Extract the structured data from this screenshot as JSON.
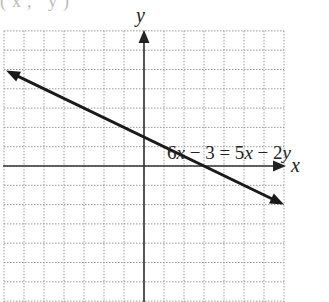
{
  "chart_data": {
    "type": "line",
    "title": "",
    "partial_top_label": "(x, y)",
    "xlabel": "x",
    "ylabel": "y",
    "xlim": [
      -7,
      7
    ],
    "ylim": [
      -7,
      7
    ],
    "grid": true,
    "grid_style": "dotted",
    "series": [
      {
        "name": "6x − 3 = 5x − 2y",
        "equation": "y = (3 - x) / 2",
        "slope": -0.5,
        "y_intercept": 1.5,
        "x_intercept": 3,
        "x": [
          -7,
          7
        ],
        "y": [
          5,
          -2
        ],
        "arrows_both_ends": true
      }
    ],
    "annotations": [
      {
        "text": "6x − 3 = 5x − 2y",
        "x": 2.2,
        "y": 1.55
      }
    ]
  },
  "labels": {
    "x_axis": "x",
    "y_axis": "y",
    "equation_parts": [
      "6",
      "x",
      " − 3 = 5",
      "x",
      " − 2",
      "y"
    ],
    "top_cut": "(x, y)"
  }
}
